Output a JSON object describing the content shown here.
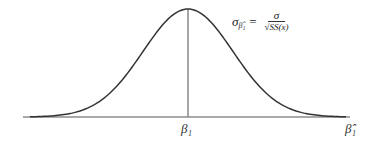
{
  "diagram": {
    "type": "normal-distribution-curve",
    "formula": {
      "lhs": "σ",
      "lhs_subscript": "β̂₁",
      "equals": "=",
      "numerator": "σ",
      "denominator": "√SS(x)"
    },
    "center_label": "β₁",
    "axis_label": "β̂₁",
    "colors": {
      "curve": "#333333",
      "axis": "#555555",
      "center_line": "#888888"
    }
  }
}
